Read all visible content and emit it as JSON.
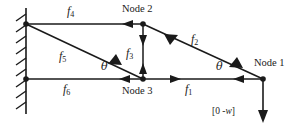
{
  "figure": {
    "type": "engineering-truss-diagram",
    "width": 292,
    "height": 128,
    "line_color": "#1a1a1a",
    "background_color": "#ffffff"
  },
  "wall": {
    "name": "fixed-support-wall",
    "x": 26,
    "y_top": 8,
    "y_bottom": 114,
    "hatch_count": 9,
    "hatch_length": 11,
    "side": "left"
  },
  "nodes": [
    {
      "id": "wall-top",
      "label": "",
      "x": 26,
      "y": 24,
      "show_dot": true,
      "label_dx": 0,
      "label_dy": 0
    },
    {
      "id": "wall-bottom",
      "label": "",
      "x": 26,
      "y": 79,
      "show_dot": true,
      "label_dx": 0,
      "label_dy": 0
    },
    {
      "id": "node-2",
      "label": "Node 2",
      "x": 143,
      "y": 24,
      "show_dot": true,
      "label_dx": 0,
      "label_dy": -16
    },
    {
      "id": "node-3",
      "label": "Node 3",
      "x": 143,
      "y": 79,
      "show_dot": true,
      "label_dx": 0,
      "label_dy": 16
    },
    {
      "id": "node-1",
      "label": "Node 1",
      "x": 263,
      "y": 79,
      "show_dot": true,
      "label_dx": 0,
      "label_dy": -18
    }
  ],
  "members": [
    {
      "id": "f4",
      "label": "f",
      "sub": "4",
      "from": "wall-top",
      "to": "node-2",
      "label_x": 73,
      "label_y": 12
    },
    {
      "id": "f2",
      "label": "f",
      "sub": "2",
      "from": "node-2",
      "to": "node-1",
      "label_x": 196,
      "label_y": 40
    },
    {
      "id": "f3",
      "label": "f",
      "sub": "3",
      "from": "node-2",
      "to": "node-3",
      "label_x": 131,
      "label_y": 54
    },
    {
      "id": "f5",
      "label": "f",
      "sub": "5",
      "from": "wall-top",
      "to": "node-3",
      "label_x": 64,
      "label_y": 57
    },
    {
      "id": "f6",
      "label": "f",
      "sub": "6",
      "from": "wall-bottom",
      "to": "node-3",
      "label_x": 68,
      "label_y": 90
    },
    {
      "id": "f1",
      "label": "f",
      "sub": "1",
      "from": "node-3",
      "to": "node-1",
      "label_x": 190,
      "label_y": 90
    }
  ],
  "angles": [
    {
      "id": "theta-left",
      "label": "θ",
      "x": 104,
      "y": 66
    },
    {
      "id": "theta-right",
      "label": "θ",
      "x": 219,
      "y": 66
    }
  ],
  "load": {
    "id": "applied-load",
    "prefix": "[0  -",
    "symbol": "w",
    "suffix": "]",
    "full_text": "[0  -w]",
    "arrow_from_x": 263,
    "arrow_from_y": 79,
    "arrow_to_x": 263,
    "arrow_to_y": 122,
    "label_x": 216,
    "label_y": 113
  },
  "arrow_marks": [
    {
      "id": "arrow-f4-left",
      "member": "f4",
      "t": 0.86,
      "dir": "left"
    },
    {
      "id": "arrow-f3-down",
      "member": "f3",
      "t": 0.3,
      "dir": "down"
    },
    {
      "id": "arrow-f3-up",
      "member": "f3",
      "t": 0.78,
      "dir": "up"
    },
    {
      "id": "arrow-f2-upleft",
      "member": "f2",
      "t": 0.22,
      "dir": "toward-node2"
    },
    {
      "id": "arrow-f2-downright",
      "member": "f2",
      "t": 0.8,
      "dir": "toward-node1"
    },
    {
      "id": "arrow-f5-toward3",
      "member": "f5",
      "t": 0.78,
      "dir": "toward-node3"
    },
    {
      "id": "arrow-f6-left",
      "member": "f6",
      "t": 0.8,
      "dir": "left"
    },
    {
      "id": "arrow-f1-right",
      "member": "f1",
      "t": 0.25,
      "dir": "right"
    },
    {
      "id": "arrow-f1-left",
      "member": "f1",
      "t": 0.82,
      "dir": "left"
    }
  ]
}
